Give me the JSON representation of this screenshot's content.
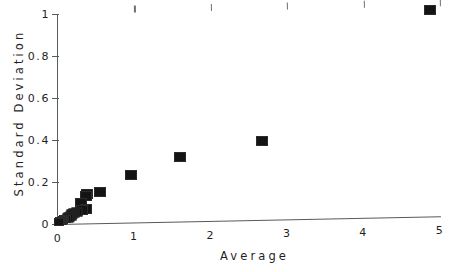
{
  "chart_data": {
    "type": "scatter",
    "title": "",
    "xlabel": "Average",
    "ylabel": "Standard Deviation",
    "xlim": [
      0,
      5
    ],
    "ylim": [
      0,
      1
    ],
    "grid": false,
    "legend": null,
    "marker_style": "filled-square",
    "marker_color": "#141414",
    "axis_color": "#555b5e",
    "background_color": "#ffffff",
    "xticks": [
      0,
      1,
      2,
      3,
      4,
      5
    ],
    "xtick_labels": [
      "0",
      "1",
      "2",
      "3",
      "4",
      "5"
    ],
    "yticks": [
      0,
      0.2,
      0.4,
      0.6,
      0.8,
      1
    ],
    "ytick_labels": [
      "0",
      "0.2",
      "0.4",
      "0.6",
      "0.8",
      "1"
    ],
    "points": [
      {
        "x": 4.87,
        "y": 0.985
      },
      {
        "x": 2.67,
        "y": 0.375
      },
      {
        "x": 1.6,
        "y": 0.305
      },
      {
        "x": 0.95,
        "y": 0.228
      },
      {
        "x": 0.55,
        "y": 0.148
      },
      {
        "x": 0.38,
        "y": 0.14
      },
      {
        "x": 0.37,
        "y": 0.131
      },
      {
        "x": 0.3,
        "y": 0.096
      },
      {
        "x": 0.36,
        "y": 0.07
      },
      {
        "x": 0.31,
        "y": 0.064
      },
      {
        "x": 0.25,
        "y": 0.055
      },
      {
        "x": 0.21,
        "y": 0.05
      },
      {
        "x": 0.185,
        "y": 0.044
      },
      {
        "x": 0.165,
        "y": 0.038
      },
      {
        "x": 0.145,
        "y": 0.032
      },
      {
        "x": 0.125,
        "y": 0.028
      },
      {
        "x": 0.105,
        "y": 0.024
      },
      {
        "x": 0.085,
        "y": 0.021
      },
      {
        "x": 0.065,
        "y": 0.019
      },
      {
        "x": 0.05,
        "y": 0.016
      },
      {
        "x": 0.035,
        "y": 0.014
      },
      {
        "x": 0.022,
        "y": 0.012
      },
      {
        "x": 0.012,
        "y": 0.01
      }
    ]
  },
  "axes": {
    "x_title": "Average",
    "y_title": "Standard Deviation"
  }
}
